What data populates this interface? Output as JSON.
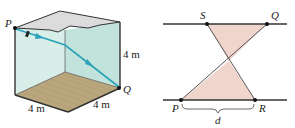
{
  "figures": [
    {
      "id": "room-cube",
      "labels": {
        "start_point": "P",
        "end_point": "Q",
        "height": "4 m",
        "width_left": "4 m",
        "width_right": "4 m"
      },
      "colors": {
        "wall_left": "#d4ebe6",
        "wall_back": "#bfe0da",
        "ceiling": "#d9d9d9",
        "floor": "#b8a47a",
        "path": "#2aa3b8",
        "edge": "#333333"
      }
    },
    {
      "id": "crossing-segments",
      "labels": {
        "top_left": "S",
        "top_right": "Q",
        "bottom_left": "P",
        "bottom_right": "R",
        "distance": "d"
      },
      "colors": {
        "fill": "#f0d4cc",
        "line": "#333333"
      }
    }
  ]
}
